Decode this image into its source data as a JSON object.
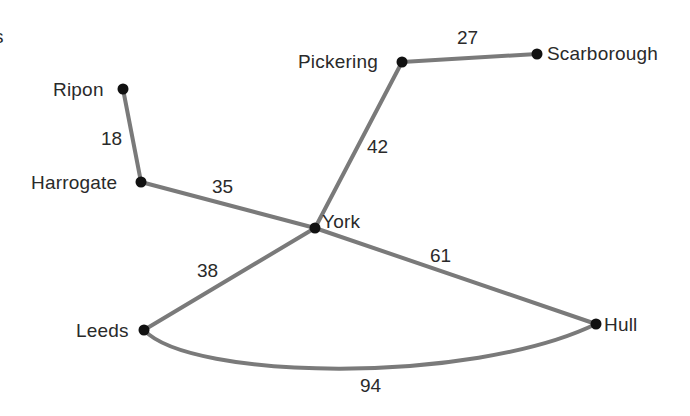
{
  "diagram": {
    "type": "weighted-graph",
    "clipped_fragment": "s",
    "colors": {
      "edge": "#7a7a7a",
      "node": "#111111",
      "text": "#2a2a2a",
      "background": "#ffffff"
    },
    "nodes": [
      {
        "id": "ripon",
        "label": "Ripon",
        "x": 123,
        "y": 89
      },
      {
        "id": "harrogate",
        "label": "Harrogate",
        "x": 141,
        "y": 182
      },
      {
        "id": "york",
        "label": "York",
        "x": 315,
        "y": 228
      },
      {
        "id": "pickering",
        "label": "Pickering",
        "x": 402,
        "y": 62
      },
      {
        "id": "scarborough",
        "label": "Scarborough",
        "x": 537,
        "y": 54
      },
      {
        "id": "leeds",
        "label": "Leeds",
        "x": 144,
        "y": 330
      },
      {
        "id": "hull",
        "label": "Hull",
        "x": 596,
        "y": 324
      }
    ],
    "edges": [
      {
        "from": "ripon",
        "to": "harrogate",
        "weight": "18"
      },
      {
        "from": "harrogate",
        "to": "york",
        "weight": "35"
      },
      {
        "from": "york",
        "to": "pickering",
        "weight": "42"
      },
      {
        "from": "pickering",
        "to": "scarborough",
        "weight": "27"
      },
      {
        "from": "york",
        "to": "leeds",
        "weight": "38"
      },
      {
        "from": "york",
        "to": "hull",
        "weight": "61"
      },
      {
        "from": "leeds",
        "to": "hull",
        "weight": "94"
      }
    ]
  }
}
